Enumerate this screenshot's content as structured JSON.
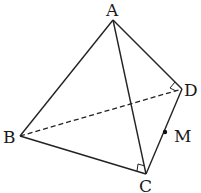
{
  "diagram": {
    "type": "tetrahedron",
    "points": {
      "A": {
        "label": "A",
        "x": 113,
        "y": 20
      },
      "B": {
        "label": "B",
        "x": 20,
        "y": 136
      },
      "C": {
        "label": "C",
        "x": 146,
        "y": 174
      },
      "D": {
        "label": "D",
        "x": 182,
        "y": 89
      },
      "M": {
        "label": "M",
        "x": 165,
        "y": 132
      }
    },
    "edges": [
      {
        "from": "A",
        "to": "B",
        "style": "solid"
      },
      {
        "from": "A",
        "to": "C",
        "style": "solid"
      },
      {
        "from": "A",
        "to": "D",
        "style": "solid"
      },
      {
        "from": "B",
        "to": "C",
        "style": "solid"
      },
      {
        "from": "C",
        "to": "D",
        "style": "solid"
      },
      {
        "from": "B",
        "to": "D",
        "style": "dashed"
      }
    ],
    "right_angles": [
      "D (angle ADB)",
      "C (angle ACB)"
    ],
    "marked_point": "M on CD",
    "line_color": "#222222"
  }
}
